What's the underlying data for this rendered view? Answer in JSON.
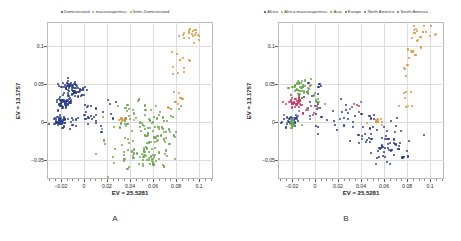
{
  "figure": {
    "panels": [
      {
        "id": "A",
        "label": "A",
        "legend": [
          {
            "label": "Domesticated",
            "color": "#2d3f8f"
          },
          {
            "label": "mucosospermus",
            "color": "#e8913a"
          },
          {
            "label": "Semi-Domesticated",
            "color": "#6aa84f"
          }
        ],
        "chart_data": {
          "type": "scatter",
          "title": "",
          "xlabel": "EV = 25.5281",
          "ylabel": "EV = 13.1757",
          "xlim": [
            -0.032,
            0.112
          ],
          "ylim": [
            -0.075,
            0.132
          ],
          "xticks": [
            -0.02,
            0,
            0.02,
            0.04,
            0.06,
            0.08,
            0.1
          ],
          "yticks": [
            -0.05,
            0,
            0.05,
            0.1
          ],
          "grid": true,
          "legend_position": "top",
          "series": [
            {
              "name": "Domesticated",
              "color": "#2d3f8f",
              "n": 215,
              "clusters": [
                {
                  "cx": -0.0115,
                  "cy": 0.0455,
                  "sx": 0.0042,
                  "sy": 0.0042,
                  "n": 58
                },
                {
                  "cx": -0.0165,
                  "cy": 0.0275,
                  "sx": 0.0038,
                  "sy": 0.0036,
                  "n": 46
                },
                {
                  "cx": -0.0205,
                  "cy": 0.0015,
                  "sx": 0.0045,
                  "sy": 0.0038,
                  "n": 52
                },
                {
                  "cx": -0.005,
                  "cy": 0.0395,
                  "sx": 0.0055,
                  "sy": 0.0045,
                  "n": 20
                },
                {
                  "cx": -0.002,
                  "cy": 0.005,
                  "sx": 0.0085,
                  "sy": 0.0105,
                  "n": 23
                },
                {
                  "cx": 0.014,
                  "cy": 0.012,
                  "sx": 0.011,
                  "sy": 0.015,
                  "n": 16
                }
              ]
            },
            {
              "name": "mucosospermus",
              "color": "#e8913a",
              "n": 48,
              "clusters": [
                {
                  "cx": 0.0935,
                  "cy": 0.1155,
                  "sx": 0.0055,
                  "sy": 0.0075,
                  "n": 18
                },
                {
                  "cx": 0.0815,
                  "cy": 0.079,
                  "sx": 0.0048,
                  "sy": 0.0115,
                  "n": 12
                },
                {
                  "cx": 0.0795,
                  "cy": 0.033,
                  "sx": 0.0035,
                  "sy": 0.0095,
                  "n": 8
                },
                {
                  "cx": 0.0335,
                  "cy": 0.0035,
                  "sx": 0.0035,
                  "sy": 0.0015,
                  "n": 10
                }
              ]
            },
            {
              "name": "Semi-Domesticated",
              "color": "#6aa84f",
              "n": 168,
              "clusters": [
                {
                  "cx": 0.0545,
                  "cy": -0.0455,
                  "sx": 0.0085,
                  "sy": 0.0085,
                  "n": 48
                },
                {
                  "cx": 0.0625,
                  "cy": -0.0175,
                  "sx": 0.0095,
                  "sy": 0.0115,
                  "n": 44
                },
                {
                  "cx": 0.0445,
                  "cy": 0.0075,
                  "sx": 0.013,
                  "sy": 0.012,
                  "n": 40
                },
                {
                  "cx": 0.033,
                  "cy": -0.0345,
                  "sx": 0.0125,
                  "sy": 0.014,
                  "n": 22
                },
                {
                  "cx": 0.0735,
                  "cy": 0.0065,
                  "sx": 0.009,
                  "sy": 0.011,
                  "n": 14
                }
              ]
            }
          ]
        }
      },
      {
        "id": "B",
        "label": "B",
        "legend": [
          {
            "label": "Africa",
            "color": "#2d3f8f"
          },
          {
            "label": "Africa-mucosospermus",
            "color": "#e8913a"
          },
          {
            "label": "Asia",
            "color": "#6aa84f"
          },
          {
            "label": "Europe",
            "color": "#c0392b"
          },
          {
            "label": "North America",
            "color": "#7e57c2"
          },
          {
            "label": "South America",
            "color": "#d6336c"
          }
        ],
        "chart_data": {
          "type": "scatter",
          "title": "",
          "xlabel": "EV = 25.5281",
          "ylabel": "EV = 13.1757",
          "xlim": [
            -0.032,
            0.112
          ],
          "ylim": [
            -0.075,
            0.132
          ],
          "xticks": [
            -0.02,
            0,
            0.02,
            0.04,
            0.06,
            0.08,
            0.1
          ],
          "yticks": [
            -0.05,
            0,
            0.05,
            0.1
          ],
          "grid": true,
          "legend_position": "top",
          "series": [
            {
              "name": "Africa",
              "color": "#2d3f8f",
              "n": 150,
              "clusters": [
                {
                  "cx": -0.0195,
                  "cy": 0.002,
                  "sx": 0.0042,
                  "sy": 0.0034,
                  "n": 34
                },
                {
                  "cx": 0.064,
                  "cy": -0.039,
                  "sx": 0.0095,
                  "sy": 0.011,
                  "n": 40
                },
                {
                  "cx": 0.0545,
                  "cy": -0.0105,
                  "sx": 0.0135,
                  "sy": 0.0125,
                  "n": 34
                },
                {
                  "cx": 0.018,
                  "cy": 0.009,
                  "sx": 0.014,
                  "sy": 0.015,
                  "n": 24
                },
                {
                  "cx": -0.006,
                  "cy": 0.033,
                  "sx": 0.0085,
                  "sy": 0.013,
                  "n": 18
                }
              ]
            },
            {
              "name": "Africa-mucosospermus",
              "color": "#e8913a",
              "n": 48,
              "clusters": [
                {
                  "cx": 0.0935,
                  "cy": 0.1155,
                  "sx": 0.0055,
                  "sy": 0.0075,
                  "n": 18
                },
                {
                  "cx": 0.0815,
                  "cy": 0.079,
                  "sx": 0.0048,
                  "sy": 0.0115,
                  "n": 12
                },
                {
                  "cx": 0.0795,
                  "cy": 0.033,
                  "sx": 0.0035,
                  "sy": 0.0095,
                  "n": 8
                },
                {
                  "cx": 0.054,
                  "cy": 0.001,
                  "sx": 0.004,
                  "sy": 0.0018,
                  "n": 10
                }
              ]
            },
            {
              "name": "Asia",
              "color": "#6aa84f",
              "n": 70,
              "clusters": [
                {
                  "cx": -0.012,
                  "cy": 0.0455,
                  "sx": 0.0048,
                  "sy": 0.0048,
                  "n": 42
                },
                {
                  "cx": -0.0195,
                  "cy": -0.001,
                  "sx": 0.004,
                  "sy": 0.003,
                  "n": 18
                },
                {
                  "cx": 0.002,
                  "cy": 0.028,
                  "sx": 0.0065,
                  "sy": 0.0075,
                  "n": 10
                }
              ]
            },
            {
              "name": "Europe",
              "color": "#c0392b",
              "n": 14,
              "clusters": [
                {
                  "cx": -0.016,
                  "cy": 0.0275,
                  "sx": 0.0045,
                  "sy": 0.0035,
                  "n": 10
                },
                {
                  "cx": 0.036,
                  "cy": 0.016,
                  "sx": 0.006,
                  "sy": 0.006,
                  "n": 4
                }
              ]
            },
            {
              "name": "North America",
              "color": "#7e57c2",
              "n": 10,
              "clusters": [
                {
                  "cx": -0.018,
                  "cy": 0.005,
                  "sx": 0.0055,
                  "sy": 0.005,
                  "n": 7
                },
                {
                  "cx": 0.029,
                  "cy": 0.021,
                  "sx": 0.008,
                  "sy": 0.007,
                  "n": 3
                }
              ]
            },
            {
              "name": "South America",
              "color": "#d6336c",
              "n": 34,
              "clusters": [
                {
                  "cx": -0.017,
                  "cy": 0.027,
                  "sx": 0.004,
                  "sy": 0.004,
                  "n": 26
                },
                {
                  "cx": -0.0065,
                  "cy": 0.0185,
                  "sx": 0.005,
                  "sy": 0.0055,
                  "n": 8
                }
              ]
            }
          ]
        }
      }
    ]
  }
}
